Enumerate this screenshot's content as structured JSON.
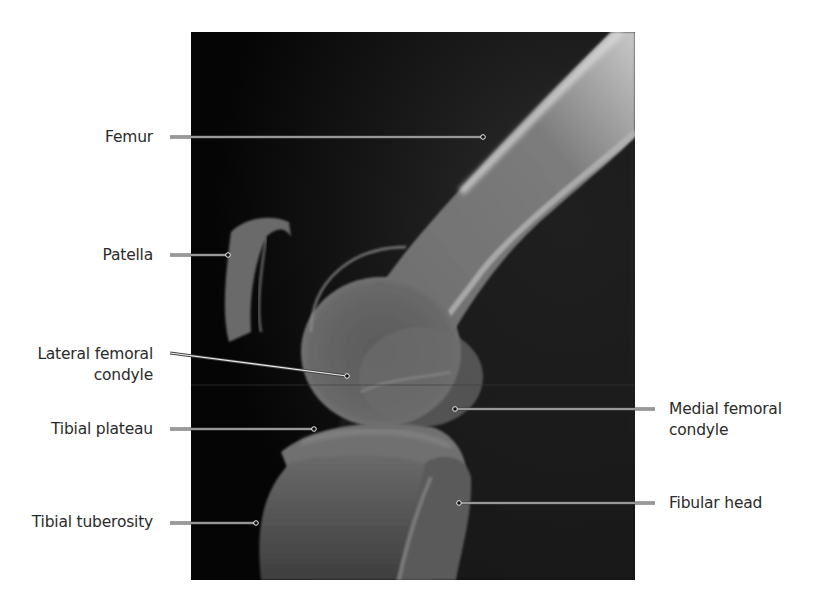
{
  "figure": {
    "background": "#ffffff",
    "xray_region": {
      "x": 191,
      "y": 32,
      "width": 444,
      "height": 548
    }
  },
  "labels": {
    "femur": {
      "text": "Femur",
      "side": "left"
    },
    "patella": {
      "text": "Patella",
      "side": "left"
    },
    "lateral_femoral_condyle": {
      "line1": "Lateral femoral",
      "line2": "condyle",
      "side": "left"
    },
    "tibial_plateau": {
      "text": "Tibial plateau",
      "side": "left"
    },
    "tibial_tuberosity": {
      "text": "Tibial tuberosity",
      "side": "left"
    },
    "medial_femoral_condyle": {
      "line1": "Medial femoral",
      "line2": "condyle",
      "side": "right"
    },
    "fibular_head": {
      "text": "Fibular head",
      "side": "right"
    }
  },
  "leaders": [
    {
      "name": "femur",
      "x1": 170,
      "y1": 137,
      "x2": 483,
      "y2": 137
    },
    {
      "name": "patella",
      "x1": 170,
      "y1": 255,
      "x2": 228,
      "y2": 255
    },
    {
      "name": "lateral_femoral_condyle",
      "x1": 170,
      "y1": 353,
      "x2": 347,
      "y2": 376
    },
    {
      "name": "tibial_plateau",
      "x1": 170,
      "y1": 429,
      "x2": 314,
      "y2": 429
    },
    {
      "name": "tibial_tuberosity",
      "x1": 170,
      "y1": 523,
      "x2": 256,
      "y2": 523
    },
    {
      "name": "medial_femoral_condyle",
      "x1": 655,
      "y1": 409,
      "x2": 455,
      "y2": 409
    },
    {
      "name": "fibular_head",
      "x1": 655,
      "y1": 503,
      "x2": 459,
      "y2": 503
    }
  ],
  "colors": {
    "label_text": "#2b2b2b",
    "leader_line": "#e8e8e8",
    "leader_outline": "#333333"
  }
}
